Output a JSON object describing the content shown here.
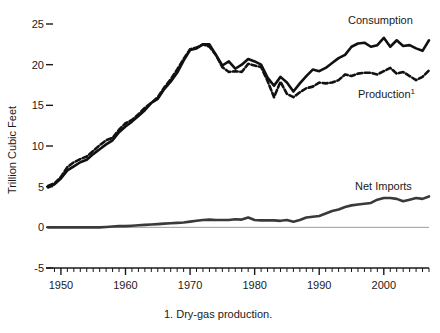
{
  "chart_data": {
    "type": "line",
    "title": "",
    "xlabel": "",
    "ylabel": "Trillion Cubic Feet",
    "xlim": [
      1948,
      2007
    ],
    "ylim": [
      -5,
      25
    ],
    "yticks": [
      -5,
      0,
      5,
      10,
      15,
      20,
      25
    ],
    "ytick_labels": [
      "-5",
      "0",
      "5",
      "10",
      "15",
      "20",
      "25"
    ],
    "xticks": [
      1950,
      1960,
      1970,
      1980,
      1990,
      2000
    ],
    "xtick_labels": [
      "1950",
      "1960",
      "1970",
      "1980",
      "1990",
      "2000"
    ],
    "x_minor_tick_interval": 1,
    "grid": false,
    "zero_line": true,
    "legend_position": "inline-right",
    "footnote": "1. Dry-gas production.",
    "x": [
      1948,
      1949,
      1950,
      1951,
      1952,
      1953,
      1954,
      1955,
      1956,
      1957,
      1958,
      1959,
      1960,
      1961,
      1962,
      1963,
      1964,
      1965,
      1966,
      1967,
      1968,
      1969,
      1970,
      1971,
      1972,
      1973,
      1974,
      1975,
      1976,
      1977,
      1978,
      1979,
      1980,
      1981,
      1982,
      1983,
      1984,
      1985,
      1986,
      1987,
      1988,
      1989,
      1990,
      1991,
      1992,
      1993,
      1994,
      1995,
      1996,
      1997,
      1998,
      1999,
      2000,
      2001,
      2002,
      2003,
      2004,
      2005,
      2006,
      2007
    ],
    "series": [
      {
        "name": "Consumption",
        "label": "Consumption",
        "style": "solid",
        "color": "#111111",
        "width": 2.6,
        "values": [
          4.9,
          5.3,
          6.0,
          7.0,
          7.5,
          8.0,
          8.3,
          9.0,
          9.6,
          10.2,
          10.7,
          11.7,
          12.4,
          13.0,
          13.7,
          14.4,
          15.3,
          15.8,
          17.0,
          17.9,
          19.0,
          20.5,
          21.8,
          22.0,
          22.5,
          22.5,
          21.2,
          19.9,
          20.4,
          19.5,
          20.0,
          20.7,
          20.4,
          20.0,
          18.4,
          17.4,
          18.5,
          17.8,
          16.7,
          17.7,
          18.6,
          19.4,
          19.2,
          19.6,
          20.2,
          20.8,
          21.2,
          22.2,
          22.6,
          22.7,
          22.2,
          22.4,
          23.3,
          22.2,
          23.0,
          22.3,
          22.4,
          22.0,
          21.7,
          23.0
        ]
      },
      {
        "name": "Production",
        "label": "Production¹",
        "style": "dashed",
        "color": "#111111",
        "width": 2.6,
        "values": [
          5.1,
          5.4,
          6.2,
          7.4,
          8.0,
          8.4,
          8.7,
          9.4,
          10.1,
          10.7,
          11.0,
          12.0,
          12.8,
          13.2,
          13.9,
          14.7,
          15.3,
          16.0,
          17.2,
          18.2,
          19.4,
          20.7,
          21.9,
          22.1,
          22.5,
          22.2,
          21.2,
          19.7,
          19.1,
          19.2,
          19.1,
          20.1,
          19.9,
          19.7,
          18.0,
          16.0,
          17.9,
          16.4,
          16.0,
          16.6,
          17.1,
          17.3,
          17.8,
          17.7,
          17.8,
          18.1,
          18.8,
          18.6,
          18.9,
          19.0,
          19.0,
          18.8,
          19.2,
          19.6,
          18.9,
          19.1,
          18.6,
          18.1,
          18.5,
          19.3
        ]
      },
      {
        "name": "Net Imports",
        "label": "Net Imports",
        "style": "solid",
        "color": "#3a3a3a",
        "width": 2.6,
        "values": [
          0.0,
          0.0,
          0.0,
          0.0,
          0.0,
          0.0,
          0.0,
          0.0,
          0.0,
          0.05,
          0.1,
          0.15,
          0.15,
          0.2,
          0.25,
          0.3,
          0.35,
          0.4,
          0.45,
          0.5,
          0.55,
          0.6,
          0.7,
          0.8,
          0.9,
          0.95,
          0.9,
          0.9,
          0.9,
          1.0,
          0.95,
          1.2,
          0.9,
          0.85,
          0.85,
          0.85,
          0.8,
          0.9,
          0.7,
          0.9,
          1.2,
          1.3,
          1.4,
          1.7,
          2.0,
          2.2,
          2.5,
          2.7,
          2.8,
          2.9,
          3.0,
          3.4,
          3.6,
          3.6,
          3.5,
          3.2,
          3.4,
          3.6,
          3.5,
          3.8
        ]
      }
    ],
    "annotations": [
      {
        "name": "consumption-label",
        "text": "Consumption",
        "x_px": 348,
        "y_px": 24
      },
      {
        "name": "production-label",
        "text": "Production",
        "sup": "1",
        "x_px": 358,
        "y_px": 98
      },
      {
        "name": "net-imports-label",
        "text": "Net Imports",
        "x_px": 355,
        "y_px": 190
      }
    ]
  },
  "axes": {
    "y_axis_title": "Trillion Cubic Feet"
  }
}
